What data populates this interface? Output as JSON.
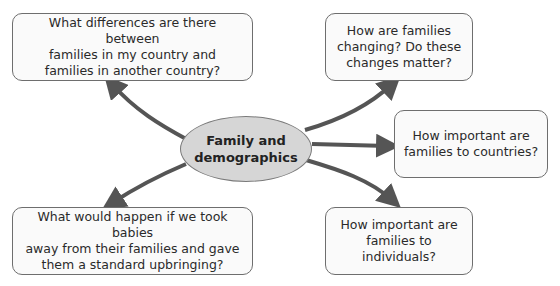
{
  "diagram": {
    "center": {
      "line1": "Family and",
      "line2": "demographics"
    },
    "nodes": [
      {
        "id": "top-left",
        "lines": [
          "What differences are there between",
          "families in my country and",
          "families in another country?"
        ]
      },
      {
        "id": "top-right",
        "lines": [
          "How are families",
          "changing? Do these",
          "changes matter?"
        ]
      },
      {
        "id": "middle-right",
        "lines": [
          "How important are",
          "families to countries?"
        ]
      },
      {
        "id": "bottom-left",
        "lines": [
          "What would happen if we took babies",
          "away from their families and gave",
          "them a standard upbringing?"
        ]
      },
      {
        "id": "bottom-right",
        "lines": [
          "How important are",
          "families to individuals?"
        ]
      }
    ],
    "colors": {
      "arrow": "#555555",
      "center_fill": "#d6d6d6",
      "box_border": "#6e6e6e"
    }
  }
}
